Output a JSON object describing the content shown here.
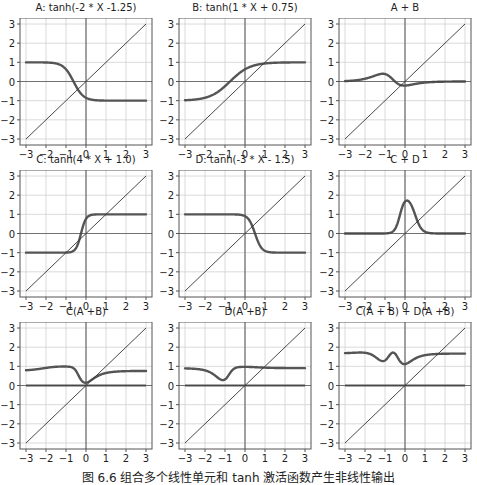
{
  "figure": {
    "caption": "图 6.6  组合多个线性单元和 tanh 激活函数产生非线性输出"
  },
  "style": {
    "curve_color": "#555555",
    "identity_color": "#333333",
    "grid_color": "#d0d0d0",
    "axis_color": "#444444",
    "frame_color": "#555555"
  },
  "chart_data": [
    {
      "type": "line",
      "title": "A: tanh(-2 * X -1.25)",
      "expression": "tanh(-2*x - 1.25)",
      "xlim": [
        -3,
        3
      ],
      "ylim": [
        -3,
        3
      ],
      "xticks": [
        -3,
        -2,
        -1,
        0,
        1,
        2,
        3
      ],
      "yticks": [
        -3,
        -2,
        -1,
        0,
        1,
        2,
        3
      ],
      "grid": true,
      "series": [
        {
          "name": "A",
          "x": [
            -3,
            -2,
            -1,
            -0.625,
            0,
            1,
            2,
            3
          ],
          "values": [
            1.0,
            0.999,
            0.462,
            0.0,
            -0.848,
            -1.0,
            -1.0,
            -1.0
          ]
        },
        {
          "name": "identity y=x",
          "x": [
            -3,
            3
          ],
          "values": [
            -3,
            3
          ]
        }
      ]
    },
    {
      "type": "line",
      "title": "B: tanh(1 * X + 0.75)",
      "expression": "tanh(1*x + 0.75)",
      "xlim": [
        -3,
        3
      ],
      "ylim": [
        -3,
        3
      ],
      "xticks": [
        -3,
        -2,
        -1,
        0,
        1,
        2,
        3
      ],
      "yticks": [
        -3,
        -2,
        -1,
        0,
        1,
        2,
        3
      ],
      "grid": true,
      "series": [
        {
          "name": "B",
          "x": [
            -3,
            -2,
            -1,
            -0.75,
            0,
            1,
            2,
            3
          ],
          "values": [
            -0.978,
            -0.834,
            -0.245,
            0.0,
            0.635,
            0.941,
            0.992,
            0.999
          ]
        },
        {
          "name": "identity y=x",
          "x": [
            -3,
            3
          ],
          "values": [
            -3,
            3
          ]
        }
      ]
    },
    {
      "type": "line",
      "title": "A + B",
      "expression": "A + B",
      "xlim": [
        -3,
        3
      ],
      "ylim": [
        -3,
        3
      ],
      "xticks": [
        -3,
        -2,
        -1,
        0,
        1,
        2,
        3
      ],
      "yticks": [
        -3,
        -2,
        -1,
        0,
        1,
        2,
        3
      ],
      "grid": true,
      "series": [
        {
          "name": "A + B",
          "x": [
            -3,
            -2,
            -1,
            0,
            1,
            2,
            3
          ],
          "values": [
            0.022,
            0.165,
            0.217,
            -0.213,
            -0.059,
            -0.008,
            -0.001
          ]
        },
        {
          "name": "identity y=x",
          "x": [
            -3,
            3
          ],
          "values": [
            -3,
            3
          ]
        }
      ]
    },
    {
      "type": "line",
      "title": "C: tanh(4 * X + 1.0)",
      "expression": "tanh(4*x + 1.0)",
      "xlim": [
        -3,
        3
      ],
      "ylim": [
        -3,
        3
      ],
      "xticks": [
        -3,
        -2,
        -1,
        0,
        1,
        2,
        3
      ],
      "yticks": [
        -3,
        -2,
        -1,
        0,
        1,
        2,
        3
      ],
      "grid": true,
      "series": [
        {
          "name": "C",
          "x": [
            -3,
            -1,
            -0.5,
            -0.25,
            0,
            0.5,
            1,
            3
          ],
          "values": [
            -1.0,
            -0.995,
            -0.762,
            0.0,
            0.762,
            0.995,
            1.0,
            1.0
          ]
        },
        {
          "name": "identity y=x",
          "x": [
            -3,
            3
          ],
          "values": [
            -3,
            3
          ]
        }
      ]
    },
    {
      "type": "line",
      "title": "D: tanh(-3 * X - 1.5)",
      "expression": "tanh(-3*x + 1.5)",
      "xlim": [
        -3,
        3
      ],
      "ylim": [
        -3,
        3
      ],
      "xticks": [
        -3,
        -2,
        -1,
        0,
        1,
        2,
        3
      ],
      "yticks": [
        -3,
        -2,
        -1,
        0,
        1,
        2,
        3
      ],
      "grid": true,
      "series": [
        {
          "name": "D",
          "x": [
            -3,
            -1,
            0,
            0.5,
            1,
            2,
            3
          ],
          "values": [
            1.0,
            1.0,
            0.905,
            0.0,
            -0.905,
            -1.0,
            -1.0
          ]
        },
        {
          "name": "identity y=x",
          "x": [
            -3,
            3
          ],
          "values": [
            -3,
            3
          ]
        }
      ]
    },
    {
      "type": "line",
      "title": "C + D",
      "expression": "C + D",
      "xlim": [
        -3,
        3
      ],
      "ylim": [
        -3,
        3
      ],
      "xticks": [
        -3,
        -2,
        -1,
        0,
        1,
        2,
        3
      ],
      "yticks": [
        -3,
        -2,
        -1,
        0,
        1,
        2,
        3
      ],
      "grid": true,
      "series": [
        {
          "name": "C + D",
          "x": [
            -3,
            -1,
            -0.5,
            0,
            0.5,
            1,
            3
          ],
          "values": [
            0.0,
            0.005,
            0.238,
            1.667,
            0.0,
            0.09,
            0.0
          ]
        },
        {
          "name": "identity y=x",
          "x": [
            -3,
            3
          ],
          "values": [
            -3,
            3
          ]
        }
      ]
    },
    {
      "type": "line",
      "title": "C(A +B)",
      "expression": "tanh(4*(A+B) + 1.0)",
      "xlim": [
        -3,
        3
      ],
      "ylim": [
        -3,
        3
      ],
      "xticks": [
        -3,
        -2,
        -1,
        0,
        1,
        2,
        3
      ],
      "yticks": [
        -3,
        -2,
        -1,
        0,
        1,
        2,
        3
      ],
      "grid": true,
      "series": [
        {
          "name": "C(A+B)",
          "x": [
            -3,
            -2,
            -1,
            0,
            1,
            2,
            3
          ],
          "values": [
            0.79,
            0.91,
            0.95,
            0.15,
            0.64,
            0.75,
            0.76
          ]
        },
        {
          "name": "zero line",
          "x": [
            -3,
            3
          ],
          "values": [
            0,
            0
          ]
        },
        {
          "name": "identity y=x",
          "x": [
            -3,
            3
          ],
          "values": [
            -3,
            3
          ]
        }
      ]
    },
    {
      "type": "line",
      "title": "D(A +B)",
      "expression": "tanh(-3*(A+B) + 1.5)",
      "xlim": [
        -3,
        3
      ],
      "ylim": [
        -3,
        3
      ],
      "xticks": [
        -3,
        -2,
        -1,
        0,
        1,
        2,
        3
      ],
      "yticks": [
        -3,
        -2,
        -1,
        0,
        1,
        2,
        3
      ],
      "grid": true,
      "series": [
        {
          "name": "D(A+B)",
          "x": [
            -3,
            -2,
            -1,
            0,
            1,
            2,
            3
          ],
          "values": [
            0.89,
            0.79,
            0.3,
            0.98,
            0.94,
            0.91,
            0.91
          ]
        },
        {
          "name": "zero line",
          "x": [
            -3,
            3
          ],
          "values": [
            0,
            0
          ]
        },
        {
          "name": "identity y=x",
          "x": [
            -3,
            3
          ],
          "values": [
            -3,
            3
          ]
        }
      ]
    },
    {
      "type": "line",
      "title": "C(A + B) + D(A +B)",
      "expression": "C(A+B) + D(A+B)",
      "xlim": [
        -3,
        3
      ],
      "ylim": [
        -3,
        3
      ],
      "xticks": [
        -3,
        -2,
        -1,
        0,
        1,
        2,
        3
      ],
      "yticks": [
        -3,
        -2,
        -1,
        0,
        1,
        2,
        3
      ],
      "grid": true,
      "series": [
        {
          "name": "C(A+B)+D(A+B)",
          "x": [
            -3,
            -2,
            -1.2,
            -0.6,
            0,
            1,
            2,
            3
          ],
          "values": [
            1.68,
            1.6,
            1.28,
            1.72,
            1.13,
            1.58,
            1.66,
            1.67
          ]
        },
        {
          "name": "zero line",
          "x": [
            -3,
            3
          ],
          "values": [
            0,
            0
          ]
        },
        {
          "name": "identity y=x",
          "x": [
            -3,
            3
          ],
          "values": [
            -3,
            3
          ]
        }
      ]
    }
  ]
}
